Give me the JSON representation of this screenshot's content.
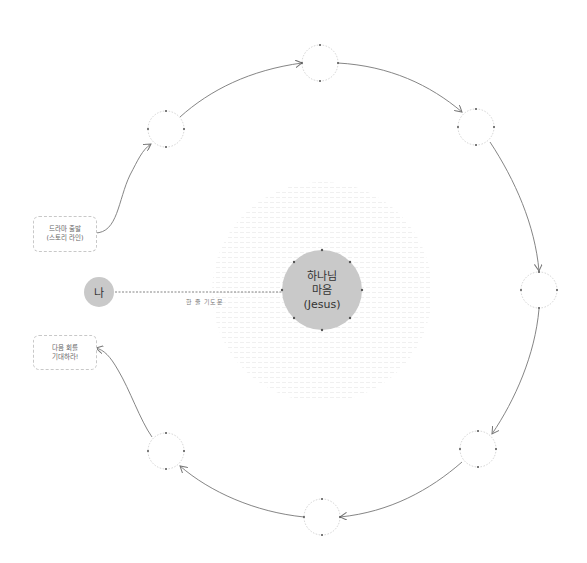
{
  "diagram": {
    "center_node": {
      "lines": [
        "하나님",
        "마음",
        "(Jesus)"
      ],
      "fill": "#c9c9c9"
    },
    "self_node": {
      "label": "나",
      "fill": "#c9c9c9"
    },
    "connector_label": "한 줄 기도문",
    "start_box": {
      "lines": [
        "드라마 출발",
        "(스토리 라인)"
      ]
    },
    "end_box": {
      "lines": [
        "다음 회를",
        "기대하라!"
      ]
    },
    "cycle_nodes": [
      {
        "id": "upper-left",
        "label": ""
      },
      {
        "id": "top",
        "label": ""
      },
      {
        "id": "upper-right",
        "label": ""
      },
      {
        "id": "right",
        "label": ""
      },
      {
        "id": "lower-right",
        "label": ""
      },
      {
        "id": "bottom",
        "label": ""
      },
      {
        "id": "lower-left",
        "label": ""
      }
    ],
    "colors": {
      "line": "#777777",
      "dashed_border": "#c8c8c8",
      "dot": "#555555",
      "background_text": "#f2f2f2"
    }
  }
}
